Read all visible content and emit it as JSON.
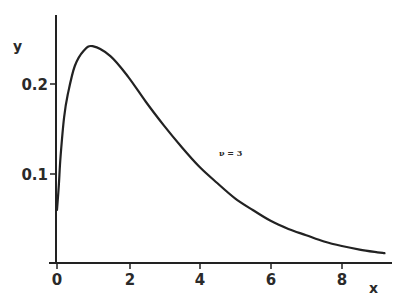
{
  "chart_data": {
    "type": "line",
    "title": "",
    "xlabel": "x",
    "ylabel": "y",
    "xlim": [
      0,
      9.2
    ],
    "ylim": [
      0,
      0.27
    ],
    "grid": false,
    "x_ticks": [
      0,
      2,
      4,
      6,
      8
    ],
    "x_tick_labels": [
      "0",
      "2",
      "4",
      "6",
      "8"
    ],
    "y_ticks": [
      0.1,
      0.2
    ],
    "y_tick_labels": [
      "0.1",
      "0.2"
    ],
    "annotations": [
      {
        "text": "ν = 3",
        "x": 4.3,
        "y": 0.132
      }
    ],
    "series": [
      {
        "name": "ν = 3",
        "x": [
          0.0,
          0.05,
          0.1,
          0.2,
          0.3,
          0.5,
          0.75,
          1.0,
          1.5,
          2.0,
          2.5,
          3.0,
          3.5,
          4.0,
          4.5,
          5.0,
          5.5,
          6.0,
          6.5,
          7.0,
          7.5,
          8.0,
          8.5,
          9.0,
          9.2
        ],
        "values": [
          0.06,
          0.087,
          0.12,
          0.163,
          0.188,
          0.22,
          0.237,
          0.242,
          0.231,
          0.208,
          0.18,
          0.154,
          0.13,
          0.108,
          0.09,
          0.073,
          0.06,
          0.048,
          0.039,
          0.032,
          0.025,
          0.02,
          0.016,
          0.013,
          0.012
        ]
      }
    ]
  },
  "labels": {
    "x_axis": "x",
    "y_axis": "y",
    "annotation": "ν = 3",
    "x_ticks": [
      "0",
      "2",
      "4",
      "6",
      "8"
    ],
    "y_ticks": [
      "0.1",
      "0.2"
    ]
  }
}
